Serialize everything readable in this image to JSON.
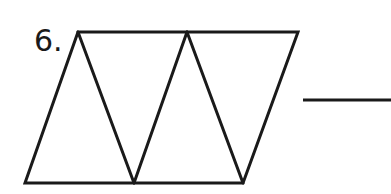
{
  "problem": {
    "number_label": "6."
  },
  "figure": {
    "stroke_color": "#1a1a1a",
    "outline": {
      "top_left": [
        78,
        32
      ],
      "top_right": [
        298,
        32
      ],
      "bottom_right": [
        243,
        183
      ],
      "bottom_left": [
        25,
        183
      ]
    },
    "top_vertices_x": [
      78,
      187,
      298
    ],
    "bottom_vertices_x": [
      25,
      134,
      243
    ],
    "triangle_count": 5
  },
  "answer_blank": {
    "value": "",
    "x1": 303,
    "x2": 391,
    "y": 100
  }
}
